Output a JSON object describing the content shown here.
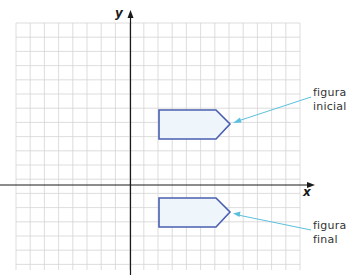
{
  "diagram": {
    "type": "coordinate-grid-translation",
    "axes": {
      "x_label": "x",
      "y_label": "y"
    },
    "colors": {
      "grid": "#d4d4d4",
      "axis": "#1a1a1a",
      "shape_stroke": "#4a5fb0",
      "shape_fill": "#eef5fb",
      "pointer": "#5bc0de",
      "text": "#333333"
    },
    "figures": [
      {
        "id": "initial",
        "label_line1": "figura",
        "label_line2": "inicial"
      },
      {
        "id": "final",
        "label_line1": "figura",
        "label_line2": "final"
      }
    ]
  }
}
